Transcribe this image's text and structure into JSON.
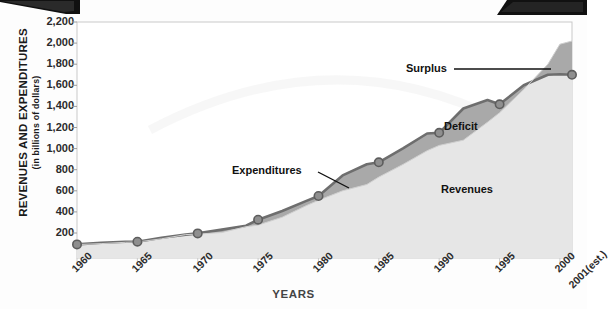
{
  "chart_data": {
    "type": "area",
    "title": "",
    "xlabel": "YEARS",
    "ylabel": "REVENUES AND EXPENDITURES",
    "ylabel_sub": "(in billions of dollars)",
    "ylim": [
      0,
      2200
    ],
    "xlim": [
      1960,
      2001
    ],
    "grid": false,
    "legend_position": "inline-annotations",
    "ytick_labels": [
      "2,200",
      "2,000",
      "1,800",
      "1,600",
      "1,400",
      "1,200",
      "1,000",
      "800",
      "600",
      "400",
      "200"
    ],
    "ytick_values": [
      2200,
      2000,
      1800,
      1600,
      1400,
      1200,
      1000,
      800,
      600,
      400,
      200
    ],
    "xtick_labels": [
      "1960",
      "1965",
      "1970",
      "1975",
      "1980",
      "1985",
      "1990",
      "1995",
      "2000"
    ],
    "xtick_values": [
      1960,
      1965,
      1970,
      1975,
      1980,
      1985,
      1990,
      1995,
      2000
    ],
    "xtick_extra_label": "2001(est.)",
    "marker_years": [
      1960,
      1965,
      1970,
      1975,
      1980,
      1985,
      1990,
      1995,
      2001
    ],
    "series": [
      {
        "name": "Revenues",
        "color": "#e6e6e6",
        "x": [
          1960,
          1962,
          1964,
          1965,
          1967,
          1969,
          1970,
          1972,
          1974,
          1975,
          1977,
          1979,
          1980,
          1982,
          1984,
          1985,
          1987,
          1989,
          1990,
          1992,
          1994,
          1995,
          1997,
          1999,
          2000,
          2001
        ],
        "values": [
          90,
          100,
          112,
          115,
          145,
          185,
          190,
          205,
          260,
          275,
          350,
          460,
          510,
          600,
          660,
          730,
          850,
          980,
          1030,
          1080,
          1250,
          1340,
          1560,
          1800,
          1990,
          2020
        ]
      },
      {
        "name": "Expenditures",
        "color": "#8f8f8f",
        "x": [
          1960,
          1962,
          1964,
          1965,
          1967,
          1969,
          1970,
          1972,
          1974,
          1975,
          1977,
          1979,
          1980,
          1982,
          1984,
          1985,
          1987,
          1989,
          1990,
          1992,
          1994,
          1995,
          1997,
          1999,
          2000,
          2001
        ],
        "values": [
          92,
          107,
          118,
          118,
          155,
          185,
          196,
          232,
          269,
          326,
          409,
          504,
          551,
          746,
          852,
          870,
          1003,
          1143,
          1150,
          1380,
          1460,
          1420,
          1600,
          1700,
          1705,
          1700
        ]
      }
    ],
    "marker_values": {
      "1960": 92,
      "1965": 118,
      "1970": 196,
      "1975": 326,
      "1980": 551,
      "1985": 870,
      "1990": 1150,
      "1995": 1420,
      "2001": 1700
    },
    "annotations": [
      {
        "label": "Surplus",
        "kind": "leader",
        "describes": "area where revenues exceed expenditures at right end"
      },
      {
        "label": "Deficit",
        "kind": "region",
        "describes": "dark gray band between revenues and expenditures"
      },
      {
        "label": "Expenditures",
        "kind": "leader",
        "describes": "upper line"
      },
      {
        "label": "Revenues",
        "kind": "region",
        "describes": "light gray filled area"
      }
    ]
  },
  "axis": {
    "y_title": "REVENUES AND EXPENDITURES",
    "y_subtitle": "(in billions of dollars)",
    "x_title": "YEARS"
  },
  "labels": {
    "surplus": "Surplus",
    "deficit": "Deficit",
    "expenditures": "Expenditures",
    "revenues": "Revenues"
  },
  "colors": {
    "revenues_fill": "#e6e6e6",
    "deficit_fill": "#a9a9a9",
    "expenditure_line": "#6e6e6e",
    "marker_fill": "#9a9a9a",
    "axis": "#b9b9b9",
    "text": "#2b2b2b"
  }
}
